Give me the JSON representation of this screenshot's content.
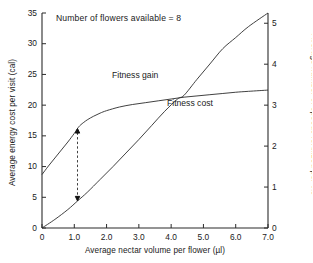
{
  "chart_data": {
    "type": "line",
    "title": "",
    "annotation": "Number of flowers available = 8",
    "xlabel": "Average nectar volume per flower (µl)",
    "ylabel": "Average energy cost per visit (cal)",
    "ylabel_right": "Average number of speeds fertilized per vis",
    "xlim": [
      0,
      7.0
    ],
    "ylim": [
      0,
      35
    ],
    "ylim_right": [
      0,
      5.25
    ],
    "grid": false,
    "legend_position": "inline-labels",
    "xticks": [
      "0",
      "1.0",
      "2.0",
      "3.0",
      "4.0",
      "5.0",
      "6.0",
      "7.0"
    ],
    "xtick_values": [
      0,
      1.0,
      2.0,
      3.0,
      4.0,
      5.0,
      6.0,
      7.0
    ],
    "yticks_left": [
      "0",
      "5",
      "10",
      "15",
      "20",
      "25",
      "30",
      "35"
    ],
    "ytick_values_left": [
      0,
      5,
      10,
      15,
      20,
      25,
      30,
      35
    ],
    "yticks_right": [
      "0",
      "1",
      "2",
      "3",
      "4",
      "5"
    ],
    "ytick_values_right": [
      0,
      1,
      2,
      3,
      4,
      5
    ],
    "series": [
      {
        "name": "Fitness gain",
        "axis": "right",
        "x": [
          0.0,
          0.2,
          0.4,
          0.6,
          0.8,
          1.0,
          1.1,
          1.2,
          1.4,
          1.6,
          1.8,
          2.0,
          2.4,
          2.8,
          3.2,
          3.6,
          4.0,
          4.4,
          4.8,
          5.2,
          5.6,
          6.0,
          6.4,
          7.0
        ],
        "values": [
          8.7,
          10.1,
          11.4,
          12.7,
          14.0,
          15.4,
          16.2,
          16.8,
          17.6,
          18.2,
          18.7,
          19.1,
          19.7,
          20.1,
          20.4,
          20.7,
          21.0,
          21.3,
          21.5,
          21.7,
          21.9,
          22.1,
          22.25,
          22.45
        ]
      },
      {
        "name": "Fitness cost",
        "axis": "left",
        "x": [
          0.0,
          0.4,
          0.8,
          1.1,
          1.4,
          1.8,
          2.2,
          2.6,
          3.0,
          3.4,
          3.8,
          4.2,
          4.4,
          4.8,
          5.2,
          5.6,
          6.0,
          6.4,
          7.0
        ],
        "values": [
          0.0,
          1.4,
          3.0,
          4.4,
          5.8,
          7.9,
          10.0,
          12.2,
          14.4,
          16.7,
          19.0,
          21.0,
          21.6,
          24.2,
          26.7,
          29.2,
          31.0,
          32.8,
          35.0
        ]
      }
    ],
    "annotations": [
      {
        "name": "net-gain-arrow",
        "type": "double-arrow-dashed",
        "x": 1.1,
        "y_top": 16.2,
        "y_bottom": 4.4
      }
    ],
    "intersection": {
      "x": 4.4,
      "y": 21.5
    }
  }
}
